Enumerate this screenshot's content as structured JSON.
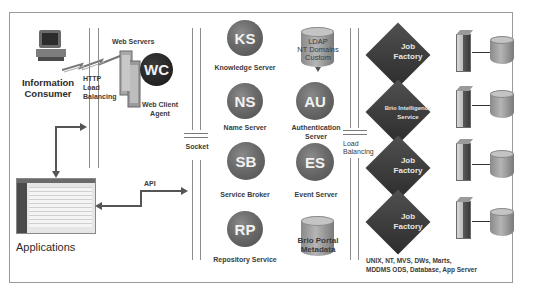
{
  "diagram": {
    "information_consumer": {
      "label_line1": "Information",
      "label_line2": "Consumer",
      "icon": "desktop-computer-icon"
    },
    "http_load_balancing": {
      "line1": "HTTP",
      "line2": "Load",
      "line3": "Balancing"
    },
    "web_servers": {
      "label": "Web Servers",
      "icon": "server-tower-icon"
    },
    "web_client": {
      "abbr": "WC",
      "label_line1": "Web Client",
      "label_line2": "Agent"
    },
    "applications": {
      "label": "Applications",
      "icon": "application-window-icon"
    },
    "api": {
      "label": "API"
    },
    "socket": {
      "label": "Socket"
    },
    "services": [
      {
        "abbr": "KS",
        "label": "Knowledge Server"
      },
      {
        "abbr": "NS",
        "label": "Name Server"
      },
      {
        "abbr": "SB",
        "label": "Service Broker"
      },
      {
        "abbr": "RP",
        "label": "Repository Service"
      }
    ],
    "ldap_store": {
      "line1": "LDAP",
      "line2": "NT Domains",
      "line3": "Custom"
    },
    "auth_server": {
      "abbr": "AU",
      "label_line1": "Authentication",
      "label_line2": "Server"
    },
    "event_server": {
      "abbr": "ES",
      "label": "Event Server"
    },
    "portal_metadata": {
      "line1": "Brio Portal",
      "line2": "Metadata"
    },
    "load_balancing": {
      "line1": "Load",
      "line2": "Balancing"
    },
    "factories": [
      {
        "line1": "Job",
        "line2": "Factory"
      },
      {
        "line1": "Brio Intelligence",
        "line2": "Service"
      },
      {
        "line1": "Job",
        "line2": "Factory"
      },
      {
        "line1": "Job",
        "line2": "Factory"
      }
    ],
    "data_sources": {
      "line1": "UNIX, NT, MVS,  DWs, Marts,",
      "line2": "MDDMS ODS, Database, App Server"
    }
  }
}
